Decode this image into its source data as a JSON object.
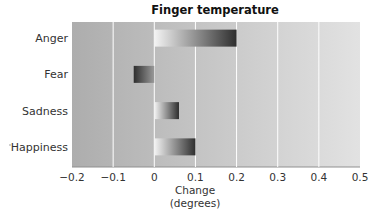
{
  "chart_data": {
    "type": "bar",
    "orientation": "horizontal",
    "title": "Finger temperature",
    "categories": [
      "Anger",
      "Fear",
      "Sadness",
      "Happiness"
    ],
    "values": [
      0.2,
      -0.05,
      0.06,
      0.1
    ],
    "xlabel": [
      "Change",
      "(degrees)"
    ],
    "ylabel": "",
    "xlim": [
      -0.2,
      0.5
    ],
    "xticks": [
      -0.2,
      -0.1,
      0,
      0.1,
      0.2,
      0.3,
      0.4,
      0.5
    ],
    "xtick_labels": [
      "−0.2",
      "−0.1",
      "0",
      "0.1",
      "0.2",
      "0.3",
      "0.4",
      "0.5"
    ],
    "grid": "vertical",
    "legend": "none",
    "colors": {
      "plot_bg_left": "#adadad",
      "plot_bg_right": "#e2e2e2",
      "gridline": "#ffffff",
      "bar_dark": "#2e2e2e",
      "bar_light": "#f4f4f4"
    }
  }
}
